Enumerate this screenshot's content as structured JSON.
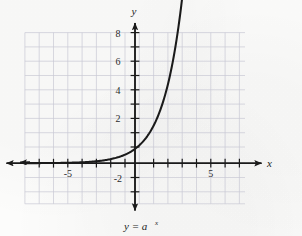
{
  "figure": {
    "caption": "y = a",
    "caption_exponent": "x",
    "axis_label_x": "x",
    "axis_label_y": "y"
  },
  "chart_data": {
    "type": "line",
    "xlabel": "x",
    "ylabel": "y",
    "xlim": [
      -7.75,
      7.75
    ],
    "ylim": [
      -2.85,
      9.1
    ],
    "grid": true,
    "legend": false,
    "xticks": [
      -7,
      -6,
      -5,
      -4,
      -3,
      -2,
      -1,
      1,
      2,
      3,
      4,
      5,
      6,
      7
    ],
    "yticks": [
      -2,
      2,
      4,
      6,
      8
    ],
    "xtick_labels": [
      "-5",
      "5"
    ],
    "xtick_label_values": [
      -5,
      5
    ],
    "ytick_labels": [
      "8",
      "6",
      "4",
      "2",
      "-2"
    ],
    "ytick_label_values": [
      8,
      6,
      4,
      2,
      -2
    ],
    "grid_x_range": [
      -7.75,
      7.75
    ],
    "grid_y_range": [
      -2.85,
      9.1
    ],
    "grid_step": 1,
    "series": [
      {
        "name": "y = a^x",
        "label": "y = a^x",
        "color": "#1a1a1a",
        "base_a": 2.1,
        "passes_through": [
          0,
          1
        ],
        "arrow_start": true,
        "arrow_end": true,
        "x": [
          -7.75,
          -7.0,
          -6.0,
          -5.0,
          -4.0,
          -3.0,
          -2.0,
          -1.5,
          -1.0,
          -0.5,
          0.0,
          0.5,
          1.0,
          1.5,
          2.0,
          2.5,
          3.0,
          3.3,
          3.5
        ],
        "y": [
          0.01,
          0.015,
          0.03,
          0.07,
          0.15,
          0.3,
          0.52,
          0.65,
          0.82,
          0.95,
          1.0,
          1.35,
          1.85,
          2.5,
          3.4,
          4.6,
          6.0,
          7.1,
          8.0
        ]
      }
    ],
    "annotations": [
      {
        "text": "y",
        "position": "top of y-axis",
        "style": "italic"
      },
      {
        "text": "x",
        "position": "right of x-axis",
        "style": "italic"
      },
      {
        "text": "y = a^x",
        "position": "below figure",
        "style": "italic"
      }
    ]
  },
  "colors": {
    "background": "#fcfcfb",
    "grid": "#c9c9d4",
    "axis": "#1a1a1a",
    "curve": "#1a1a1a",
    "text": "#2b2b2b"
  }
}
